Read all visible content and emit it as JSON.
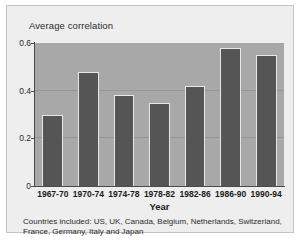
{
  "figure": {
    "y_axis_title": "Average correlation",
    "x_axis_title": "Year",
    "caption": "Countries included: US, UK, Canada, Belgium, Netherlands, Switzerland, France, Germany, Italy and Japan"
  },
  "colors": {
    "card_background": "#eeeeee",
    "card_border": "#c4c4c4",
    "plot_background": "#a8a8a8",
    "bar_fill": "#555555",
    "bar_outline": "#e8e8e8",
    "gridline": "#969696",
    "axis_line": "#4a4a4a",
    "text": "#1a1a1a"
  },
  "chart_data": {
    "type": "bar",
    "title": "",
    "subtitle": "",
    "xlabel": "Year",
    "ylabel": "Average correlation",
    "categories": [
      "1967-70",
      "1970-74",
      "1974-78",
      "1978-82",
      "1982-86",
      "1986-90",
      "1990-94"
    ],
    "values": [
      0.3,
      0.48,
      0.38,
      0.35,
      0.42,
      0.58,
      0.55
    ],
    "ylim": [
      0,
      0.6
    ],
    "yticks": [
      0,
      0.2,
      0.4,
      0.6
    ],
    "ytick_labels": [
      "0",
      "0.2",
      "0.4",
      "0.6"
    ],
    "gridlines": [
      0.2,
      0.4
    ],
    "grid": true,
    "legend": false,
    "legend_position": "none",
    "annotations": [
      "Countries included: US, UK, Canada, Belgium, Netherlands, Switzerland, France, Germany, Italy and Japan"
    ]
  }
}
